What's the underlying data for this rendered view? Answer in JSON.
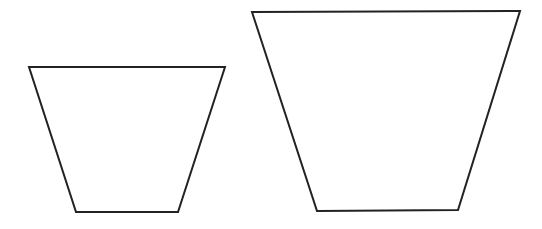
{
  "diagram": {
    "width": 542,
    "height": 229,
    "background": "#ffffff",
    "stroke_color": "#222222",
    "stroke_width": 2,
    "shapes": [
      {
        "name": "small-trapezoid",
        "type": "trapezoid",
        "points": [
          [
            29,
            67
          ],
          [
            225,
            67
          ],
          [
            178,
            212
          ],
          [
            76,
            212
          ]
        ]
      },
      {
        "name": "large-trapezoid",
        "type": "trapezoid",
        "points": [
          [
            252,
            12
          ],
          [
            520,
            11
          ],
          [
            458,
            210
          ],
          [
            317,
            211
          ]
        ]
      }
    ]
  }
}
